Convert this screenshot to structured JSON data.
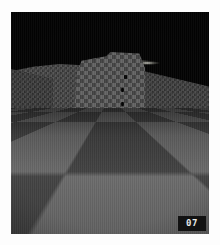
{
  "app": {
    "kind": "retro-3d-game-screenshot",
    "border_color": "#fdfdfd"
  },
  "scene": {
    "sky_label": "night-sky",
    "sky_color": "#040404",
    "light_label": "distant-light-glow",
    "floor_label": "checkerboard-floor",
    "floor_light_color": "#6d6d6d",
    "floor_dark_color": "#454545",
    "walls": [
      {
        "name": "wall-left",
        "label": "checkered-wall-left"
      },
      {
        "name": "wall-tower",
        "label": "checkered-tower-center"
      },
      {
        "name": "wall-right",
        "label": "checkered-wall-right"
      },
      {
        "name": "wall-left-tall",
        "label": "checkered-wall-left-tall"
      }
    ],
    "markers": [
      {
        "name": "dark-window-1",
        "label": "dark-opening"
      },
      {
        "name": "dark-window-2",
        "label": "dark-opening"
      },
      {
        "name": "dark-window-3",
        "label": "dark-opening"
      }
    ]
  },
  "hud": {
    "counter": "07",
    "counter_label": "level-counter",
    "badge_bg": "#121212",
    "text_color": "#e9e9e9"
  }
}
